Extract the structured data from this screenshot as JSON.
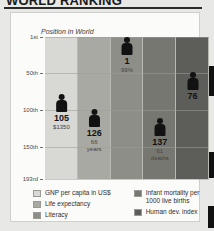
{
  "headline": {
    "text": "WORLD RANKING"
  },
  "chart": {
    "plot_label": "Position in World",
    "y_ticks": [
      "1st",
      "50th",
      "100th",
      "150th",
      "193rd"
    ]
  },
  "legend": {
    "column1": [
      {
        "label": "GNP per capita in US$",
        "color": "#d8d8d4"
      },
      {
        "label": "Life expectancy",
        "color": "#a9a9a4"
      },
      {
        "label": "Literacy",
        "color": "#8e8e89"
      }
    ],
    "column2": [
      {
        "label": "Infant mortality per 1000 live births",
        "color": "#777772"
      },
      {
        "label": "Human dev. index",
        "color": "#5d5d59"
      }
    ]
  },
  "chart_data": {
    "type": "bar",
    "title": "WORLD RANKING",
    "subtitle": "Position in World",
    "xlabel": "",
    "ylabel": "Position in World",
    "ylim": [
      1,
      193
    ],
    "y_inverted": true,
    "grid": true,
    "y_tick_labels": [
      "1st",
      "50th",
      "100th",
      "150th",
      "193rd"
    ],
    "y_tick_values": [
      1,
      50,
      100,
      150,
      193
    ],
    "legend_position": "bottom",
    "categories": [
      "GNP per capita in US$",
      "Life expectancy",
      "Literacy",
      "Infant mortality per 1000 live births",
      "Human dev. index"
    ],
    "values": [
      105,
      126,
      1,
      137,
      76
    ],
    "annotations": [
      "$1350",
      "66 years",
      "99%",
      "61 deaths",
      ""
    ],
    "series": [
      {
        "name": "Position in World",
        "points": [
          {
            "category": "GNP per capita in US$",
            "rank": 105,
            "rank_label": "105",
            "value_label": "$1350",
            "band_color": "#d8d8d4"
          },
          {
            "category": "Life expectancy",
            "rank": 126,
            "rank_label": "126",
            "value_label": "66 years",
            "band_color": "#a9a9a4"
          },
          {
            "category": "Literacy",
            "rank": 1,
            "rank_label": "1",
            "value_label": "99%",
            "band_color": "#8e8e89"
          },
          {
            "category": "Infant mortality per 1000 live births",
            "rank": 137,
            "rank_label": "137",
            "value_label": "61 deaths",
            "band_color": "#777772"
          },
          {
            "category": "Human dev. index",
            "rank": 76,
            "rank_label": "76",
            "value_label": "",
            "band_color": "#5d5d59"
          }
        ]
      }
    ]
  }
}
